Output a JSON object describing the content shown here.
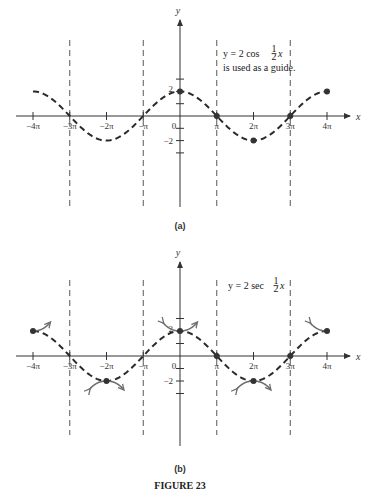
{
  "chart_data": [
    {
      "type": "line",
      "panel": "(a)",
      "title": "",
      "xlabel": "x",
      "ylabel": "y",
      "x_ticks": [
        "-4π",
        "-3π",
        "-2π",
        "-π",
        "0",
        "π",
        "2π",
        "3π",
        "4π"
      ],
      "y_ticks": [
        "2",
        "-2"
      ],
      "xlim": [
        "-4π",
        "4π"
      ],
      "ylim": [
        -4,
        4
      ],
      "annotation": [
        "y = 2 cos ½x",
        "is used as a guide."
      ],
      "asymptotes": [
        "-3π",
        "-π",
        "π",
        "3π"
      ],
      "series": [
        {
          "name": "y = 2 cos ½x",
          "style": "dashed",
          "x": [
            "-4π",
            "-3π",
            "-2π",
            "-π",
            "0",
            "π",
            "2π",
            "3π",
            "4π"
          ],
          "y": [
            2,
            0,
            -2,
            0,
            2,
            0,
            -2,
            0,
            2
          ]
        }
      ],
      "marked_points": [
        [
          "0",
          2
        ],
        [
          "π",
          0
        ],
        [
          "2π",
          -2
        ],
        [
          "3π",
          0
        ],
        [
          "4π",
          2
        ]
      ]
    },
    {
      "type": "line",
      "panel": "(b)",
      "title": "",
      "xlabel": "x",
      "ylabel": "y",
      "x_ticks": [
        "-4π",
        "-3π",
        "-2π",
        "-π",
        "0",
        "π",
        "2π",
        "3π",
        "4π"
      ],
      "y_ticks": [
        "2",
        "-2"
      ],
      "xlim": [
        "-4π",
        "4π"
      ],
      "ylim": [
        -4,
        4
      ],
      "annotation": [
        "y = 2 sec ½x"
      ],
      "asymptotes": [
        "-3π",
        "-π",
        "π",
        "3π"
      ],
      "series": [
        {
          "name": "y = 2 cos ½x",
          "style": "dashed",
          "x": [
            "-4π",
            "-3π",
            "-2π",
            "-π",
            "0",
            "π",
            "2π",
            "3π",
            "4π"
          ],
          "y": [
            2,
            0,
            -2,
            0,
            2,
            0,
            -2,
            0,
            2
          ]
        },
        {
          "name": "y = 2 sec ½x",
          "style": "solid",
          "x": [
            "-4π",
            "-2π",
            "0",
            "2π",
            "4π"
          ],
          "y": [
            2,
            -2,
            2,
            -2,
            2
          ]
        }
      ]
    }
  ],
  "labels": {
    "panel_a": "(a)",
    "panel_b": "(b)",
    "figure": "FIGURE 23",
    "x_axis": "x",
    "y_axis": "y",
    "ticks_x": [
      "−4π",
      "−3π",
      "−2π",
      "−π",
      "0",
      "π",
      "2π",
      "3π",
      "4π"
    ],
    "tick_y_pos": "2",
    "tick_y_neg": "−2",
    "note_a_line1": "y = 2 cos ",
    "note_a_line2": "is used as a guide.",
    "note_b": "y = 2 sec ",
    "frac_num": "1",
    "frac_den": "2",
    "frac_var": "x"
  },
  "colors": {
    "axis": "#333333",
    "guide": "#2a2a2a",
    "secant": "#6e6e6e",
    "asymptote": "#444444"
  }
}
